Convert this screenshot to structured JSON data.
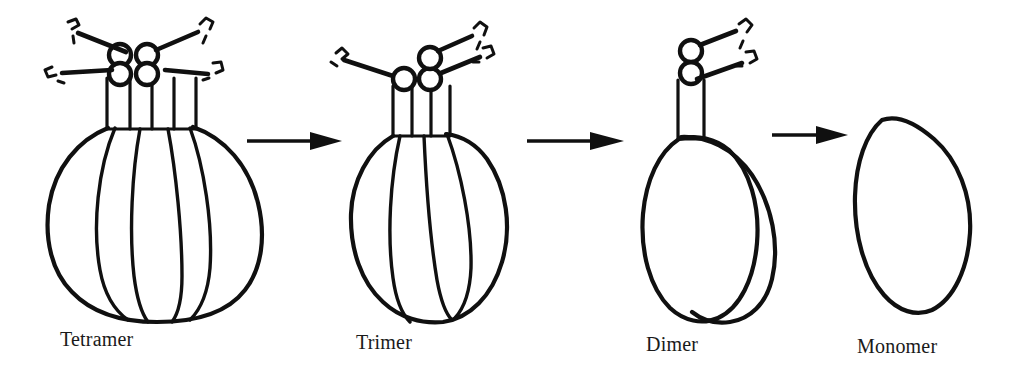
{
  "figure": {
    "background_color": "#ffffff",
    "ink_color": "#101010",
    "width": 1019,
    "height": 383
  },
  "stages": [
    {
      "id": "tetramer",
      "label": "Tetramer",
      "subunit_count": 4,
      "arm_count": 4,
      "node_count": 4,
      "label_x": 60,
      "label_y": 333
    },
    {
      "id": "trimer",
      "label": "Trimer",
      "subunit_count": 3,
      "arm_count": 3,
      "node_count": 3,
      "label_x": 356,
      "label_y": 336
    },
    {
      "id": "dimer",
      "label": "Dimer",
      "subunit_count": 2,
      "arm_count": 2,
      "node_count": 2,
      "label_x": 646,
      "label_y": 338
    },
    {
      "id": "monomer",
      "label": "Monomer",
      "subunit_count": 1,
      "arm_count": 0,
      "node_count": 0,
      "label_x": 857,
      "label_y": 340
    }
  ],
  "arrows": [
    {
      "id": "arrow-tetramer-to-trimer",
      "from": "tetramer",
      "to": "trimer",
      "direction": "right"
    },
    {
      "id": "arrow-trimer-to-dimer",
      "from": "trimer",
      "to": "dimer",
      "direction": "right"
    },
    {
      "id": "arrow-dimer-to-monomer",
      "from": "dimer",
      "to": "monomer",
      "direction": "right"
    }
  ]
}
